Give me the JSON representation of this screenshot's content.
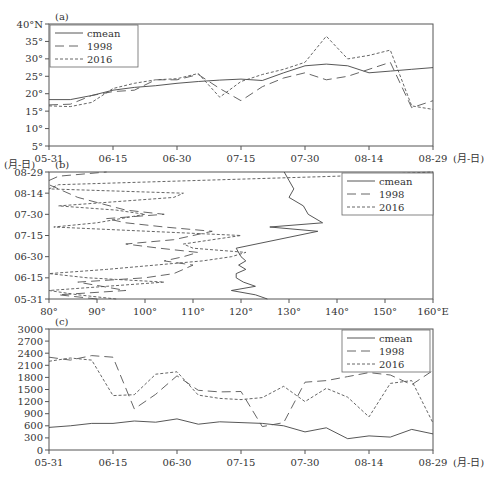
{
  "figure": {
    "x_unit_label": "(月-日)",
    "date_ticks": [
      "05-31",
      "06-15",
      "06-30",
      "07-15",
      "07-30",
      "08-14",
      "08-29"
    ]
  },
  "chart_data": [
    {
      "panel": "(a)",
      "type": "line",
      "title": "(a)",
      "xlabel": "(月-日)",
      "ylabel": "",
      "x": [
        "05-31",
        "06-05",
        "06-10",
        "06-15",
        "06-20",
        "06-25",
        "06-30",
        "07-05",
        "07-10",
        "07-15",
        "07-20",
        "07-25",
        "07-30",
        "08-04",
        "08-09",
        "08-14",
        "08-19",
        "08-24",
        "08-29"
      ],
      "yticks": [
        "5°",
        "10°",
        "15°",
        "20°",
        "25°",
        "30°",
        "35°",
        "40°N"
      ],
      "ylim": [
        5,
        40
      ],
      "legend": [
        "cmean",
        "1998",
        "2016"
      ],
      "legend_position": "upper left",
      "series": [
        {
          "name": "cmean",
          "style": "solid",
          "values": [
            18.3,
            18.3,
            19.5,
            21.0,
            21.8,
            22.3,
            23.0,
            23.5,
            23.9,
            24.2,
            23.8,
            26.0,
            28.0,
            28.5,
            28.0,
            26.0,
            26.5,
            27.0,
            27.5
          ]
        },
        {
          "name": "1998",
          "style": "long-dash",
          "values": [
            16.8,
            17.0,
            19.5,
            20.6,
            21.0,
            24.0,
            24.0,
            25.5,
            21.5,
            18.0,
            22.0,
            24.5,
            26.0,
            24.0,
            25.0,
            27.0,
            29.0,
            16.0,
            18.0
          ]
        },
        {
          "name": "2016",
          "style": "short-dash",
          "values": [
            16.5,
            16.3,
            17.5,
            21.5,
            23.0,
            24.0,
            24.3,
            25.8,
            19.0,
            23.5,
            25.5,
            27.0,
            29.0,
            36.5,
            30.0,
            31.0,
            32.5,
            16.5,
            15.5
          ]
        }
      ]
    },
    {
      "panel": "(b)",
      "type": "line",
      "title": "(b)",
      "xlabel": "°E",
      "ylabel": "(月-日)",
      "xticks": [
        "80°",
        "90°",
        "100°",
        "110°",
        "120°",
        "130°",
        "140°",
        "150°",
        "160°E"
      ],
      "xlim": [
        80,
        160
      ],
      "yticks": [
        "05-31",
        "06-15",
        "06-30",
        "07-15",
        "07-30",
        "08-14",
        "08-29"
      ],
      "legend": [
        "cmean",
        "1998",
        "2016"
      ],
      "legend_position": "upper right",
      "series": [
        {
          "name": "cmean",
          "style": "solid",
          "points": [
            [
              125.5,
              0
            ],
            [
              123,
              3
            ],
            [
              118,
              6
            ],
            [
              123,
              9
            ],
            [
              120.5,
              12
            ],
            [
              119,
              15
            ],
            [
              119,
              18
            ],
            [
              121,
              21
            ],
            [
              119.5,
              24
            ],
            [
              121,
              27
            ],
            [
              120,
              30
            ],
            [
              119,
              36
            ],
            [
              136,
              48
            ],
            [
              126,
              51
            ],
            [
              137,
              54
            ],
            [
              134,
              60
            ],
            [
              133,
              66
            ],
            [
              130,
              72
            ],
            [
              131,
              78
            ],
            [
              130,
              84
            ],
            [
              129,
              90
            ]
          ]
        },
        {
          "name": "1998",
          "style": "long-dash",
          "points": [
            [
              90,
              0
            ],
            [
              82,
              3
            ],
            [
              96,
              6
            ],
            [
              86,
              12
            ],
            [
              100,
              15
            ],
            [
              106,
              18
            ],
            [
              108,
              21
            ],
            [
              110,
              24
            ],
            [
              104,
              27
            ],
            [
              108,
              30
            ],
            [
              111,
              33
            ],
            [
              103,
              36
            ],
            [
              96,
              39
            ],
            [
              106,
              42
            ],
            [
              110,
              45
            ],
            [
              114,
              48
            ],
            [
              104,
              51
            ],
            [
              96,
              54
            ],
            [
              92,
              57
            ],
            [
              104,
              60
            ],
            [
              96,
              63
            ],
            [
              86,
              72
            ],
            [
              80,
              81
            ],
            [
              80,
              84
            ],
            [
              82,
              87
            ],
            [
              92,
              90
            ]
          ]
        },
        {
          "name": "2016",
          "style": "short-dash",
          "points": [
            [
              94,
              0
            ],
            [
              86,
              3
            ],
            [
              80,
              6
            ],
            [
              92,
              9
            ],
            [
              104,
              12
            ],
            [
              88,
              15
            ],
            [
              80,
              18
            ],
            [
              92,
              21
            ],
            [
              112,
              27
            ],
            [
              118,
              30
            ],
            [
              121,
              33
            ],
            [
              110,
              36
            ],
            [
              108,
              39
            ],
            [
              120,
              45
            ],
            [
              81,
              51
            ],
            [
              90,
              54
            ],
            [
              100,
              60
            ],
            [
              94,
              63
            ],
            [
              82,
              66
            ],
            [
              106,
              72
            ],
            [
              108,
              75
            ],
            [
              80,
              78
            ],
            [
              82,
              81
            ],
            [
              140,
              87
            ],
            [
              160,
              90
            ]
          ]
        }
      ]
    },
    {
      "panel": "(c)",
      "type": "line",
      "title": "(c)",
      "xlabel": "(月-日)",
      "ylabel": "",
      "x": [
        "05-31",
        "06-05",
        "06-10",
        "06-15",
        "06-20",
        "06-25",
        "06-30",
        "07-05",
        "07-10",
        "07-15",
        "07-20",
        "07-25",
        "07-30",
        "08-04",
        "08-09",
        "08-14",
        "08-19",
        "08-24",
        "08-29"
      ],
      "yticks": [
        "0",
        "300",
        "600",
        "900",
        "1200",
        "1500",
        "1800",
        "2100",
        "2400",
        "2700",
        "3000"
      ],
      "ylim": [
        0,
        3000
      ],
      "legend": [
        "cmean",
        "1998",
        "2016"
      ],
      "legend_position": "upper right",
      "series": [
        {
          "name": "cmean",
          "style": "solid",
          "values": [
            560,
            600,
            660,
            660,
            720,
            690,
            770,
            640,
            700,
            680,
            660,
            600,
            450,
            550,
            280,
            350,
            320,
            510,
            400
          ]
        },
        {
          "name": "1998",
          "style": "long-dash",
          "values": [
            2300,
            2230,
            2340,
            2300,
            1020,
            1380,
            1840,
            1480,
            1440,
            1450,
            580,
            680,
            1680,
            1720,
            1820,
            1920,
            1860,
            1620,
            1970
          ]
        },
        {
          "name": "2016",
          "style": "short-dash",
          "values": [
            2200,
            2280,
            2230,
            1350,
            1370,
            1880,
            1940,
            1360,
            1280,
            1250,
            1300,
            1580,
            1200,
            1530,
            1310,
            820,
            1650,
            1720,
            670
          ]
        }
      ]
    }
  ]
}
